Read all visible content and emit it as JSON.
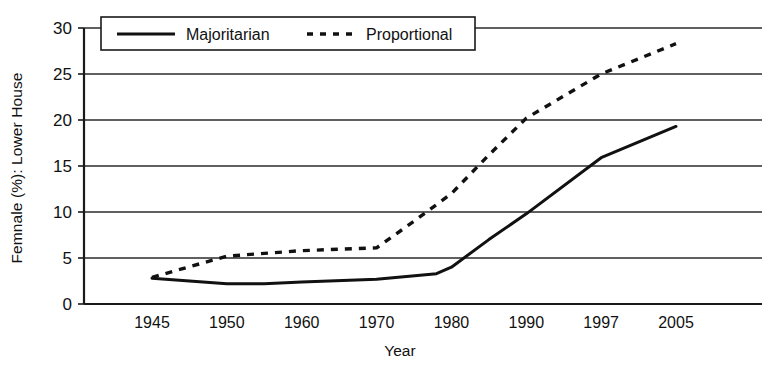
{
  "chart_data": {
    "type": "line",
    "title": "",
    "xlabel": "Year",
    "ylabel": "Femnale (%): Lower House",
    "ylim": [
      0,
      30
    ],
    "yticks": [
      0,
      5,
      10,
      15,
      20,
      25,
      30
    ],
    "grid": true,
    "grid_axis": "y",
    "legend_position": "top-center",
    "x": [
      1945,
      1950,
      1960,
      1970,
      1980,
      1990,
      1997,
      2005
    ],
    "xtick_labels": [
      "1945",
      "1950",
      "1960",
      "1970",
      "1980",
      "1990",
      "1997",
      "2005"
    ],
    "series": [
      {
        "name": "Majoritarian",
        "style": "solid",
        "color": "#111111",
        "x": [
          1945,
          1950,
          1955,
          1960,
          1970,
          1978,
          1980,
          1985,
          1990,
          1997,
          2005
        ],
        "values": [
          2.8,
          2.2,
          2.2,
          2.4,
          2.7,
          3.3,
          4.0,
          7.0,
          9.8,
          15.9,
          19.3
        ]
      },
      {
        "name": "Proportional",
        "style": "dashed",
        "color": "#111111",
        "x": [
          1945,
          1950,
          1955,
          1960,
          1970,
          1975,
          1980,
          1985,
          1990,
          1997,
          2005
        ],
        "values": [
          2.9,
          5.2,
          5.5,
          5.8,
          6.1,
          9.0,
          12.0,
          16.2,
          20.2,
          25.0,
          28.3
        ]
      }
    ]
  },
  "legend": {
    "entries": [
      {
        "label": "Majoritarian",
        "style": "solid"
      },
      {
        "label": "Proportional",
        "style": "dashed"
      }
    ]
  },
  "axes": {
    "y_axis_title": "Femnale (%): Lower House",
    "x_axis_title": "Year",
    "y_tick_labels": [
      "30",
      "25",
      "20",
      "15",
      "10",
      "5",
      "0"
    ],
    "x_tick_labels": [
      "1945",
      "1950",
      "1960",
      "1970",
      "1980",
      "1990",
      "1997",
      "2005"
    ]
  }
}
